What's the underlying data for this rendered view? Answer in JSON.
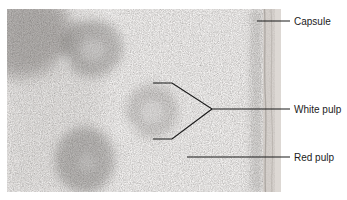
{
  "figure": {
    "type": "labeled-micrograph",
    "labels": [
      {
        "id": "capsule",
        "text": "Capsule"
      },
      {
        "id": "white-pulp",
        "text": "White pulp"
      },
      {
        "id": "red-pulp",
        "text": "Red pulp"
      }
    ],
    "colors": {
      "background": "#ffffff",
      "leader_line": "#1a1a1a",
      "label_text": "#1b1b1b",
      "tissue_base": "#b3afac",
      "nodule_dark": "#413d3a",
      "capsule_strip": "#cdc7c2",
      "capsule_edge": "#ded9d5"
    }
  }
}
